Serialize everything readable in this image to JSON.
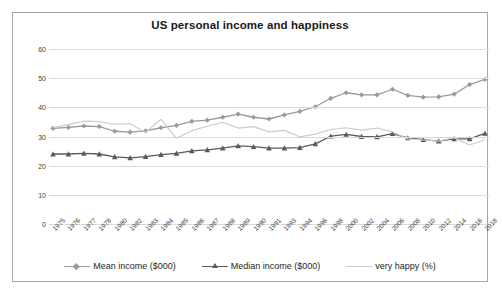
{
  "chart_data": {
    "type": "line",
    "title": "US personal income and happiness",
    "xlabel": "",
    "ylabel": "",
    "ylim": [
      0,
      60
    ],
    "yticks": [
      0,
      10,
      20,
      30,
      40,
      50,
      60
    ],
    "grid": true,
    "legend_position": "bottom",
    "categories": [
      "1975",
      "1976",
      "1977",
      "1978",
      "1980",
      "1982",
      "1983",
      "1984",
      "1985",
      "1986",
      "1987",
      "1988",
      "1989",
      "1990",
      "1991",
      "1993",
      "1994",
      "1996",
      "1998",
      "2000",
      "2002",
      "2004",
      "2006",
      "2008",
      "2010",
      "2012",
      "2014",
      "2016",
      "2018"
    ],
    "series": [
      {
        "name": "Mean income ($000)",
        "color": "#9a9a9a",
        "marker": "diamond",
        "values": [
          32.8,
          33.1,
          33.6,
          33.4,
          31.8,
          31.5,
          31.9,
          33.0,
          33.8,
          35.2,
          35.6,
          36.6,
          37.7,
          36.6,
          36.0,
          37.4,
          38.6,
          40.2,
          43.1,
          45.0,
          44.3,
          44.3,
          46.2,
          44.1,
          43.5,
          43.6,
          44.5,
          47.8,
          49.6
        ]
      },
      {
        "name": "Median income ($000)",
        "color": "#5a5a5a",
        "marker": "triangle",
        "values": [
          24.0,
          24.0,
          24.2,
          24.0,
          23.0,
          22.7,
          23.1,
          23.8,
          24.2,
          25.1,
          25.4,
          26.0,
          26.8,
          26.5,
          26.0,
          26.0,
          26.2,
          27.5,
          30.1,
          30.7,
          30.0,
          29.9,
          31.0,
          29.5,
          28.9,
          28.4,
          29.2,
          29.2,
          31.1
        ]
      },
      {
        "name": "very happy (%)",
        "color": "#cccccc",
        "marker": "none",
        "values": [
          33.0,
          34.1,
          35.3,
          35.1,
          34.2,
          34.4,
          31.4,
          35.9,
          29.4,
          32.0,
          33.5,
          34.9,
          32.9,
          33.4,
          31.6,
          32.1,
          29.9,
          30.8,
          32.4,
          33.0,
          32.2,
          32.9,
          31.6,
          29.2,
          28.8,
          28.4,
          29.6,
          27.1,
          28.9
        ]
      }
    ]
  },
  "caption": {
    "text": ""
  }
}
